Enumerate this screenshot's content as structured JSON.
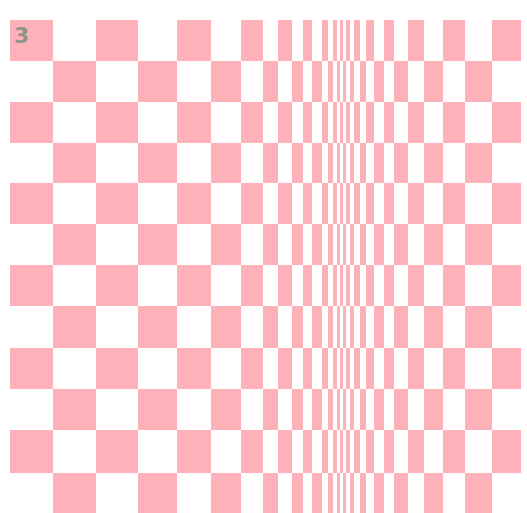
{
  "figure": {
    "label": "3",
    "label_color": "#8f9488",
    "pink": "#ffb1b9",
    "background": "#ffffff"
  },
  "pattern": {
    "type": "bulging checkerboard (op-art)",
    "column_edges": [
      10,
      53,
      96,
      138,
      177,
      211,
      241,
      263,
      278,
      292,
      303,
      312,
      322,
      328,
      333,
      337,
      340,
      343,
      346,
      350,
      354,
      360,
      366,
      374,
      384,
      394,
      408,
      424,
      443,
      465,
      492,
      521
    ],
    "row_edges": [
      20,
      61,
      102,
      143,
      183,
      224,
      265,
      306,
      348,
      389,
      430,
      473,
      513
    ],
    "first_cell_filled": true
  }
}
